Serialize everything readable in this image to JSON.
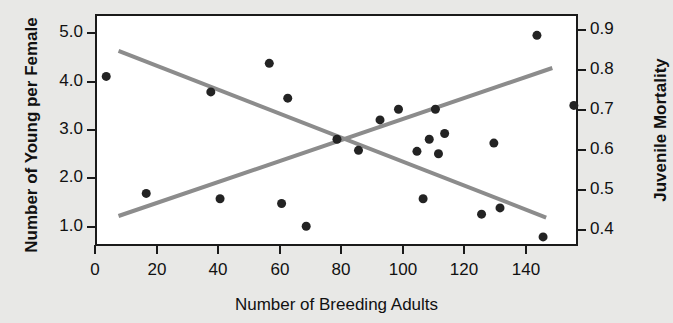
{
  "chart_data": {
    "type": "scatter",
    "title": "",
    "xlabel": "Number of Breeding Adults",
    "ylabel": "Number of Young per Female",
    "y2label": "Juvenile Mortality",
    "xlim": [
      0,
      157
    ],
    "ylim": [
      0.6,
      5.4
    ],
    "y2lim": [
      0.36,
      0.94
    ],
    "grid": false,
    "legend": null,
    "xticks": [
      0,
      20,
      40,
      60,
      80,
      100,
      120,
      140
    ],
    "xticklabels": [
      "0",
      "20",
      "40",
      "60",
      "80",
      "100",
      "120",
      "140"
    ],
    "yticks": [
      1.0,
      2.0,
      3.0,
      4.0,
      5.0
    ],
    "yticklabels": [
      "1.0",
      "2.0",
      "3.0",
      "4.0",
      "5.0"
    ],
    "y2ticks": [
      0.4,
      0.5,
      0.6,
      0.7,
      0.8,
      0.9
    ],
    "y2ticklabels": [
      "0.4",
      "0.5",
      "0.6",
      "0.7",
      "0.8",
      "0.9"
    ],
    "marker": "filled-circle",
    "marker_color": "#232323",
    "marker_size": 9,
    "trendline_color": "#8c8c8c",
    "series": [
      {
        "name": "Number of Young per Female",
        "axis": "left",
        "points": [
          {
            "x": 3,
            "y": 4.15
          },
          {
            "x": 16,
            "y": 1.73
          },
          {
            "x": 37,
            "y": 3.83
          },
          {
            "x": 40,
            "y": 1.62
          },
          {
            "x": 56,
            "y": 4.42
          },
          {
            "x": 60,
            "y": 1.52
          },
          {
            "x": 62,
            "y": 3.7
          },
          {
            "x": 68,
            "y": 1.05
          },
          {
            "x": 78,
            "y": 2.85
          },
          {
            "x": 85,
            "y": 2.62
          },
          {
            "x": 92,
            "y": 3.25
          },
          {
            "x": 98,
            "y": 3.47
          },
          {
            "x": 104,
            "y": 2.6
          },
          {
            "x": 106,
            "y": 1.62
          },
          {
            "x": 108,
            "y": 2.85
          },
          {
            "x": 110,
            "y": 3.47
          },
          {
            "x": 111,
            "y": 2.55
          },
          {
            "x": 113,
            "y": 2.97
          },
          {
            "x": 125,
            "y": 1.3
          },
          {
            "x": 129,
            "y": 2.77
          },
          {
            "x": 131,
            "y": 1.43
          },
          {
            "x": 143,
            "y": 5.0
          },
          {
            "x": 145,
            "y": 0.83
          },
          {
            "x": 155,
            "y": 3.55
          }
        ]
      }
    ],
    "trendlines": [
      {
        "name": "young-per-female-trend",
        "axis": "left",
        "direction": "decreasing",
        "x_start": 7,
        "y_start": 4.68,
        "x_end": 146,
        "y_end": 1.23
      },
      {
        "name": "juvenile-mortality-trend",
        "axis": "right",
        "direction": "increasing",
        "x_start": 7,
        "y_start": 0.44,
        "x_end": 148,
        "y_end": 0.81
      }
    ]
  },
  "axes": {
    "x": {
      "title": "Number of Breeding Adults",
      "ticks": [
        {
          "value": 0,
          "label": "0"
        },
        {
          "value": 20,
          "label": "20"
        },
        {
          "value": 40,
          "label": "40"
        },
        {
          "value": 60,
          "label": "60"
        },
        {
          "value": 80,
          "label": "80"
        },
        {
          "value": 100,
          "label": "100"
        },
        {
          "value": 120,
          "label": "120"
        },
        {
          "value": 140,
          "label": "140"
        }
      ]
    },
    "y_left": {
      "title": "Number of Young per Female",
      "ticks": [
        {
          "value": 5.0,
          "label": "5.0"
        },
        {
          "value": 4.0,
          "label": "4.0"
        },
        {
          "value": 3.0,
          "label": "3.0"
        },
        {
          "value": 2.0,
          "label": "2.0"
        },
        {
          "value": 1.0,
          "label": "1.0"
        }
      ]
    },
    "y_right": {
      "title": "Juvenile Mortality",
      "ticks": [
        {
          "value": 0.9,
          "label": "0.9"
        },
        {
          "value": 0.8,
          "label": "0.8"
        },
        {
          "value": 0.7,
          "label": "0.7"
        },
        {
          "value": 0.6,
          "label": "0.6"
        },
        {
          "value": 0.5,
          "label": "0.5"
        },
        {
          "value": 0.4,
          "label": "0.4"
        }
      ]
    }
  },
  "colors": {
    "background": "#e8e8e6",
    "plot_background": "#ffffff",
    "axis": "#1a1a1a",
    "marker": "#232323",
    "trendline": "#8c8c8c",
    "text": "#111111"
  }
}
